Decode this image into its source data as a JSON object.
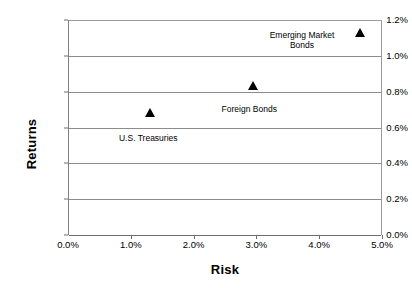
{
  "chart_data": {
    "type": "scatter",
    "title": "",
    "xlabel": "Risk",
    "ylabel": "Returns",
    "xlim": [
      0.0,
      5.0
    ],
    "ylim": [
      0.0,
      1.2
    ],
    "grid": true,
    "legend": "none",
    "x_tick_labels": [
      "0.0%",
      "1.0%",
      "2.0%",
      "3.0%",
      "4.0%",
      "5.0%"
    ],
    "x_tick_values": [
      0.0,
      1.0,
      2.0,
      3.0,
      4.0,
      5.0
    ],
    "y_tick_labels": [
      "0.0%",
      "0.2%",
      "0.4%",
      "0.6%",
      "0.8%",
      "1.0%",
      "1.2%"
    ],
    "y_tick_values": [
      0.0,
      0.2,
      0.4,
      0.6,
      0.8,
      1.0,
      1.2
    ],
    "marker": "triangle-up",
    "marker_color": "#000000",
    "grid_color": "#8c8c8c",
    "points": [
      {
        "name": "U.S. Treasuries",
        "label": "U.S. Treasuries",
        "x": 1.31,
        "y": 0.68,
        "label_dx": -2,
        "label_dy": 20,
        "label_width": 84
      },
      {
        "name": "Foreign Bonds",
        "label": "Foreign Bonds",
        "x": 2.95,
        "y": 0.83,
        "label_dx": -4,
        "label_dy": 18,
        "label_width": 84
      },
      {
        "name": "Emerging Market Bonds",
        "label": "Emerging Market\nBonds",
        "x": 4.65,
        "y": 1.13,
        "label_dx": -58,
        "label_dy": -3,
        "label_width": 94
      }
    ]
  }
}
